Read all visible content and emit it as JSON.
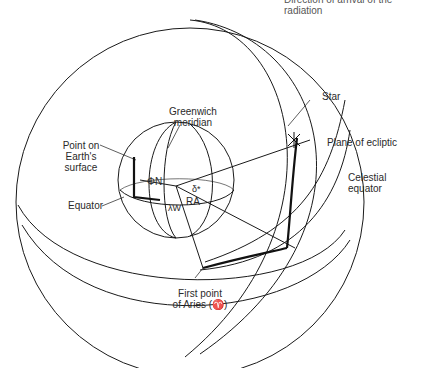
{
  "caption_top": "Direction of arrival of the radiation",
  "labels": {
    "star": "Star",
    "plane_of_ecliptic": "Plane of ecliptic",
    "celestial_equator_1": "Celestial",
    "celestial_equator_2": "equator",
    "greenwich_1": "Greenwich",
    "greenwich_2": "meridian",
    "point_1": "Point  on",
    "point_2": "Earth's",
    "point_3": "surface",
    "equator": "Equator",
    "phi_n": "ΦN",
    "delta_star": "δ*",
    "lambda_w": "λW",
    "ra": "RA",
    "aries_1": "First point",
    "aries_2": "of Aries (♈)"
  },
  "colors": {
    "line": "#1a1a1a",
    "background": "#ffffff"
  }
}
